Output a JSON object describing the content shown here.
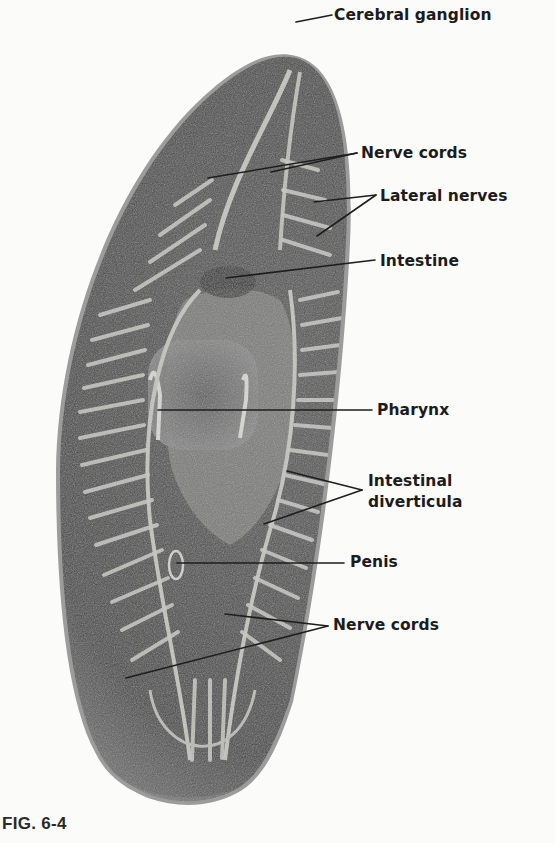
{
  "figure": {
    "caption": "FIG. 6-4",
    "colors": {
      "background": "#fbfbfa",
      "body_dark": "#3e3e3e",
      "body_mid": "#6a6a6a",
      "body_edge": "#9a9a9a",
      "nerve_light": "#c9c9c4",
      "label_text": "#1c1c1c",
      "leader_line": "#1e1e1e"
    },
    "labels": [
      {
        "id": "cerebral-ganglion",
        "lines": [
          "Cerebral ganglion"
        ],
        "x": 334,
        "y": 5,
        "pointers": [
          {
            "from": [
              332,
              15
            ],
            "to": [
              296,
              22
            ]
          }
        ]
      },
      {
        "id": "nerve-cords-anterior",
        "lines": [
          "Nerve cords"
        ],
        "x": 361,
        "y": 143,
        "pointers": [
          {
            "from": [
              357,
              153
            ],
            "to": [
              271,
              172
            ]
          },
          {
            "from": [
              357,
              153
            ],
            "to": [
              208,
              178
            ]
          }
        ]
      },
      {
        "id": "lateral-nerves",
        "lines": [
          "Lateral nerves"
        ],
        "x": 380,
        "y": 186,
        "pointers": [
          {
            "from": [
              376,
              195
            ],
            "to": [
              314,
              202
            ]
          },
          {
            "from": [
              376,
              195
            ],
            "to": [
              317,
              236
            ]
          }
        ]
      },
      {
        "id": "intestine",
        "lines": [
          "Intestine"
        ],
        "x": 380,
        "y": 251,
        "pointers": [
          {
            "from": [
              375,
              260
            ],
            "to": [
              226,
              278
            ]
          }
        ]
      },
      {
        "id": "pharynx",
        "lines": [
          "Pharynx"
        ],
        "x": 377,
        "y": 400,
        "pointers": [
          {
            "from": [
              372,
              410
            ],
            "to": [
              158,
              410
            ]
          }
        ]
      },
      {
        "id": "intestinal-diverticula",
        "lines": [
          "Intestinal",
          "diverticula"
        ],
        "x": 368,
        "y": 471,
        "pointers": [
          {
            "from": [
              362,
              490
            ],
            "to": [
              287,
              471
            ]
          },
          {
            "from": [
              362,
              490
            ],
            "to": [
              264,
              524
            ]
          }
        ]
      },
      {
        "id": "penis",
        "lines": [
          "Penis"
        ],
        "x": 350,
        "y": 552,
        "pointers": [
          {
            "from": [
              344,
              563
            ],
            "to": [
              177,
              563
            ]
          }
        ]
      },
      {
        "id": "nerve-cords-posterior",
        "lines": [
          "Nerve cords"
        ],
        "x": 333,
        "y": 615,
        "pointers": [
          {
            "from": [
              328,
              626
            ],
            "to": [
              225,
              614
            ]
          },
          {
            "from": [
              328,
              626
            ],
            "to": [
              126,
              678
            ]
          }
        ]
      }
    ]
  }
}
